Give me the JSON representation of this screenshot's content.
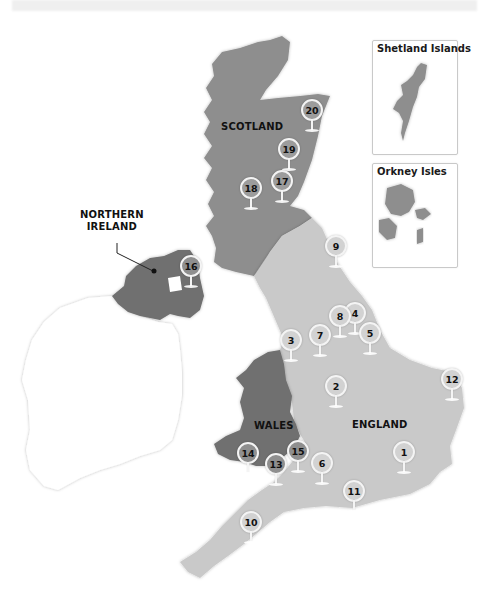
{
  "map": {
    "regions": [
      {
        "id": "scotland",
        "label": "SCOTLAND",
        "color": "#8e8e8e"
      },
      {
        "id": "northern-ireland",
        "label_lines": [
          "NORTHERN",
          "IRELAND"
        ],
        "color": "#707070"
      },
      {
        "id": "wales",
        "label": "WALES",
        "color": "#707070"
      },
      {
        "id": "england",
        "label": "ENGLAND",
        "color": "#c9c9c9"
      },
      {
        "id": "ireland",
        "color": "#ffffff"
      }
    ],
    "labels": {
      "scotland": "SCOTLAND",
      "ni_line1": "NORTHERN",
      "ni_line2": "IRELAND",
      "wales": "WALES",
      "england": "ENGLAND"
    },
    "insets": [
      {
        "title": "Shetland Islands"
      },
      {
        "title": "Orkney Isles"
      }
    ],
    "pins": [
      {
        "number": "1",
        "region": "england"
      },
      {
        "number": "2",
        "region": "england"
      },
      {
        "number": "3",
        "region": "england"
      },
      {
        "number": "4",
        "region": "england"
      },
      {
        "number": "5",
        "region": "england"
      },
      {
        "number": "6",
        "region": "england"
      },
      {
        "number": "7",
        "region": "england"
      },
      {
        "number": "8",
        "region": "england"
      },
      {
        "number": "9",
        "region": "england"
      },
      {
        "number": "10",
        "region": "england"
      },
      {
        "number": "11",
        "region": "england"
      },
      {
        "number": "12",
        "region": "england"
      },
      {
        "number": "13",
        "region": "wales"
      },
      {
        "number": "14",
        "region": "wales"
      },
      {
        "number": "15",
        "region": "wales"
      },
      {
        "number": "16",
        "region": "northern-ireland"
      },
      {
        "number": "17",
        "region": "scotland"
      },
      {
        "number": "18",
        "region": "scotland"
      },
      {
        "number": "19",
        "region": "scotland"
      },
      {
        "number": "20",
        "region": "scotland"
      }
    ],
    "colors": {
      "scotland": "#8e8e8e",
      "northern_ireland": "#707070",
      "wales": "#707070",
      "england": "#c9c9c9",
      "pin_light": "#d2d2d2",
      "pin_dark": "#8f8f8f",
      "outline": "#f4f4f4"
    }
  }
}
